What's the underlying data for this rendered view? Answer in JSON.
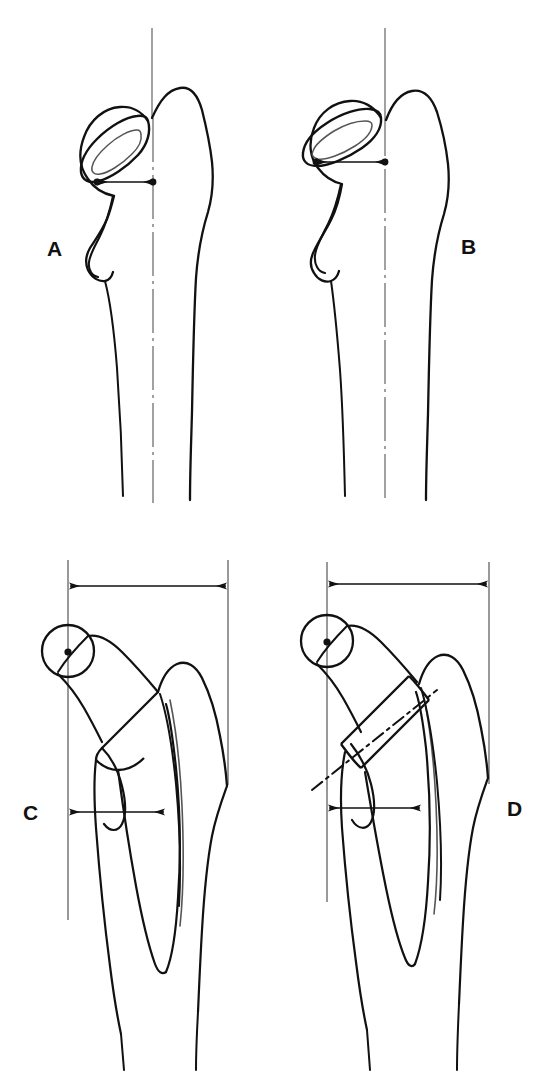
{
  "figure": {
    "kind": "medical-line-drawing",
    "background_color": "#ffffff",
    "ink_color": "#111111",
    "panel_count": 4
  },
  "panels": [
    {
      "id": "A",
      "label": "A",
      "label_side": "left",
      "view": "axial / superior view of proximal femur with neck resection ellipse",
      "features": [
        "vertical reference axis line through shaft",
        "dash-dot shaft centerline",
        "neck resection ellipse with inner elongated oval",
        "double-headed horizontal measurement arrow between two endpoint dots"
      ],
      "offset_arrow": {
        "relative_length": "short"
      }
    },
    {
      "id": "B",
      "label": "B",
      "label_side": "right",
      "view": "axial / superior view of proximal femur with neck resection ellipse, increased anteversion",
      "features": [
        "vertical reference axis line through shaft",
        "dash-dot shaft centerline",
        "neck resection ellipse with inner elongated oval",
        "double-headed horizontal measurement arrow between two endpoint dots"
      ],
      "offset_arrow": {
        "relative_length": "long"
      }
    },
    {
      "id": "C",
      "label": "C",
      "label_side": "left",
      "view": "anteroposterior view of proximal femur with implanted stem prosthesis",
      "features": [
        "femoral head circle with centre dot",
        "left vertical reference line through head centre",
        "right vertical reference line at lateral cortex",
        "upper double-headed horizontal arrow spanning both reference lines",
        "lower short double-headed horizontal arrow",
        "prosthetic stem outline within medullary canal"
      ]
    },
    {
      "id": "D",
      "label": "D",
      "label_side": "right",
      "view": "anteroposterior view of proximal femur with implanted stem prosthesis and osteotomy line",
      "features": [
        "femoral head circle with centre dot",
        "left vertical reference line through head centre",
        "right vertical reference line at lateral cortex",
        "upper double-headed horizontal arrow spanning both reference lines",
        "lower short double-headed horizontal arrow",
        "dash-dot oblique neck osteotomy line",
        "prosthetic stem collar and stem outline within medullary canal"
      ]
    }
  ],
  "colors": {
    "ink": "#111111",
    "line": "#1a1a1a",
    "thin_line": "#555555",
    "background": "#ffffff"
  }
}
